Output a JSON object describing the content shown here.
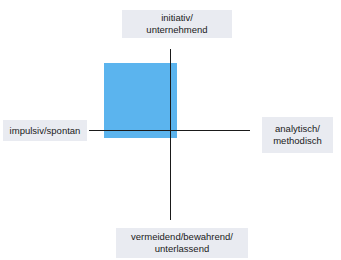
{
  "diagram": {
    "type": "quadrant-axes",
    "axes": {
      "top": {
        "line1": "initiativ/",
        "line2": "unternehmend"
      },
      "bottom": {
        "line1": "vermeidend/bewahrend/",
        "line2": "unterlassend"
      },
      "left": {
        "line1": "impulsiv/spontan"
      },
      "right": {
        "line1": "analytisch/",
        "line2": "methodisch"
      }
    },
    "highlighted_quadrant": "top-left",
    "colors": {
      "highlight": "#5bb4ee",
      "axis": "#1a1a1a",
      "label_background": "#e9ebf1",
      "label_text": "#1a1a1a"
    }
  }
}
